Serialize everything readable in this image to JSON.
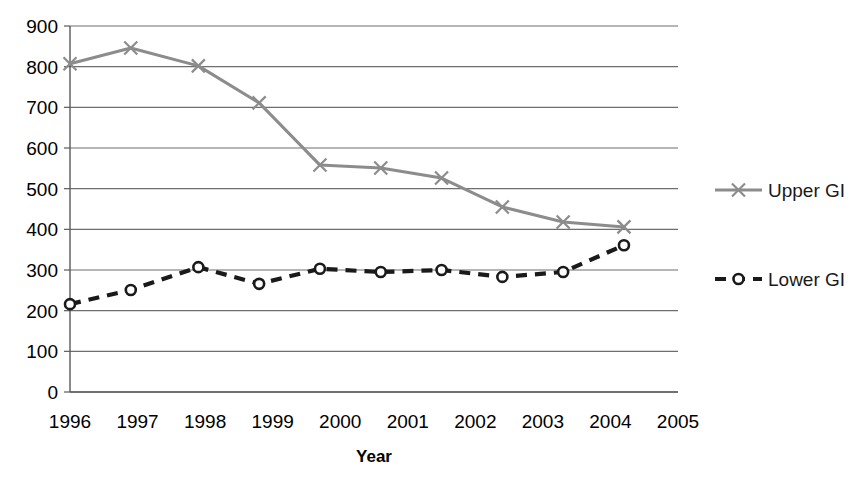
{
  "chart_data": {
    "type": "line",
    "title": "",
    "xlabel": "Year",
    "ylabel": "",
    "xlim": [
      1996,
      2005
    ],
    "ylim": [
      0,
      900
    ],
    "grid": true,
    "legend_position": "right",
    "x_tick_labels": [
      "1996",
      "1997",
      "1998",
      "1999",
      "2000",
      "2001",
      "2002",
      "2003",
      "2004",
      "2005"
    ],
    "y_tick_labels": [
      "0",
      "100",
      "200",
      "300",
      "400",
      "500",
      "600",
      "700",
      "800",
      "900"
    ],
    "x_ticks": [
      1996,
      1997,
      1998,
      1999,
      2000,
      2001,
      2002,
      2003,
      2004,
      2005
    ],
    "y_ticks": [
      0,
      100,
      200,
      300,
      400,
      500,
      600,
      700,
      800,
      900
    ],
    "series": [
      {
        "name": "Upper GI",
        "color": "#8c8c8c",
        "marker": "x",
        "line_style": "solid",
        "x": [
          1996.0,
          1996.9,
          1997.9,
          1998.8,
          1999.7,
          2000.6,
          2001.5,
          2002.4,
          2003.3,
          2004.2
        ],
        "values": [
          807,
          846,
          802,
          711,
          558,
          551,
          526,
          455,
          418,
          406
        ]
      },
      {
        "name": "Lower GI",
        "color": "#1a1a1a",
        "marker": "o",
        "line_style": "dashed",
        "x": [
          1996.0,
          1996.9,
          1997.9,
          1998.8,
          1999.7,
          2000.6,
          2001.5,
          2002.4,
          2003.3,
          2004.2
        ],
        "values": [
          216,
          251,
          307,
          266,
          303,
          295,
          300,
          283,
          295,
          361
        ]
      }
    ]
  },
  "legend": {
    "entries": [
      {
        "label": "Upper GI"
      },
      {
        "label": "Lower GI"
      }
    ]
  },
  "axes": {
    "x_title": "Year"
  }
}
